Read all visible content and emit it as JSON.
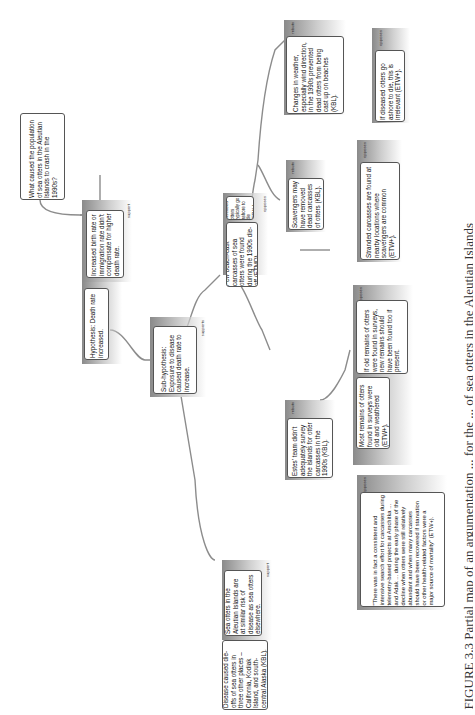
{
  "diagram": {
    "orientation": "rotated 90° counter-clockwise",
    "caption": "FIGURE 3.3 Partial map of an argumentation ... for the ... of sea otters in the Aleutian Islands",
    "root": {
      "text": "What caused the population of sea otters in the Aleutian Islands to crash in the 1990s?"
    },
    "nodes": {
      "hypothesis": {
        "text": "Hypothesis: Death rate increased."
      },
      "birth_rate": {
        "tag": "support",
        "text": "Increased birth rate or immigration rate didn't compensate for higher death rate."
      },
      "sub_hypothesis": {
        "tag": "supports",
        "text": "Sub-hypothesis: Exposure to disease caused death rate to increase."
      },
      "similar_risk": {
        "tag": "support",
        "text": "Sea otters in the Aleutian Islands are at similar risk of disease as sea otters elsewhere."
      },
      "dieoffs": {
        "text": "Disease caused die-offs of sea otters in three other places – California, Kodiak Island, and south-central Alaska (KBL)."
      },
      "few_carcasses": {
        "tag": "opposes",
        "text": "Few beach-cast carcasses of sea otters were found during the 1990s die-off (ETMD)."
      },
      "go_ashore": {
        "text": "Diseased otters typically go ashore to die (ETW+)."
      },
      "weather": {
        "tag": "rebuts",
        "text": "Changes in weather, especially wind direction, in the 1990s prevented dead otters from being cast up on beaches (KBL)."
      },
      "irrelevant": {
        "tag": "opposes",
        "text": "If diseased otters go ashore to die, this is irrelevant (ETW+)."
      },
      "scavengers": {
        "tag": "rebuts",
        "text": "Scavengers may have removed dead carcasses of otters (KBL)."
      },
      "stranded": {
        "tag": "opposes",
        "text": "Stranded carcasses are found at nearby locations where scavengers are common (ETW+)."
      },
      "estes": {
        "tag": "rebuts",
        "text": "Estes' team didn't adequately survey the islands for otter carcasses in the 1990s (KBL)."
      },
      "old_remains": {
        "tag": "opposes",
        "text": "Most remains of otters found in surveys were old and weathered (ETW+)."
      },
      "new_remains": {
        "text": "If old remains of otters were found in surveys, new remains should have been found too if present."
      },
      "quote": {
        "tag": "opposes",
        "text": "\"There was in fact a consistent and intensive search effort for carcasses during telemetry-based projects at Amchitka ... and Adak ... during the early phase of the decline when otters were still relatively abundant and when many carcasses should have been recovered if starvation or other health-related factors were a major source of mortality\" (ETW+)."
      }
    }
  },
  "colors": {
    "box_border": "#555555",
    "connector": "#8c8c8c",
    "panel_dark": "#8e8e8e",
    "panel_light": "#f4f4f4"
  }
}
